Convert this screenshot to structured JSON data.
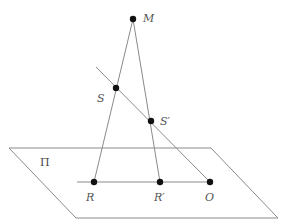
{
  "diagram": {
    "type": "geometry-projection",
    "plane": {
      "label": "Π",
      "corners": [
        [
          9,
          148
        ],
        [
          211,
          148
        ],
        [
          278,
          218
        ],
        [
          76,
          218
        ]
      ],
      "label_pos": [
        40,
        166
      ]
    },
    "points": {
      "M": {
        "label": "M",
        "x": 133,
        "y": 19,
        "label_x": 143,
        "label_y": 22
      },
      "S": {
        "label": "S",
        "x": 116,
        "y": 88,
        "label_x": 97,
        "label_y": 102
      },
      "S_prime": {
        "label": "S′",
        "x": 151,
        "y": 121,
        "label_x": 160,
        "label_y": 125
      },
      "R": {
        "label": "R",
        "x": 94,
        "y": 182,
        "label_x": 86,
        "label_y": 201
      },
      "R_prime": {
        "label": "R′",
        "x": 160,
        "y": 182,
        "label_x": 154,
        "label_y": 201
      },
      "O": {
        "label": "O",
        "x": 210,
        "y": 182,
        "label_x": 205,
        "label_y": 201
      }
    },
    "lines": [
      {
        "name": "line-M-R",
        "from": [
          133,
          19
        ],
        "to": [
          94,
          182
        ]
      },
      {
        "name": "line-M-Rprime",
        "from": [
          133,
          19
        ],
        "to": [
          160,
          182
        ]
      },
      {
        "name": "line-S-O",
        "from": [
          96,
          67
        ],
        "to": [
          210,
          182
        ]
      },
      {
        "name": "line-R-O",
        "from": [
          77,
          182
        ],
        "to": [
          210,
          182
        ]
      }
    ],
    "colors": {
      "line": "#8a8a8a",
      "point": "#111111",
      "label": "#555555"
    }
  }
}
